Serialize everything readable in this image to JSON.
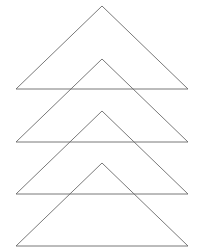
{
  "diagram": {
    "title": "",
    "stroke_color": "#6a6a6a",
    "background": "#ffffff",
    "shapes": [
      {
        "type": "triangle",
        "apex": [
          102,
          6
        ],
        "base_left": [
          16,
          89
        ],
        "base_right": [
          188,
          89
        ]
      },
      {
        "type": "triangle",
        "apex": [
          102,
          59
        ],
        "base_left": [
          16,
          142
        ],
        "base_right": [
          188,
          142
        ]
      },
      {
        "type": "triangle",
        "apex": [
          102,
          111
        ],
        "base_left": [
          16,
          194
        ],
        "base_right": [
          188,
          194
        ]
      },
      {
        "type": "triangle",
        "apex": [
          102,
          163
        ],
        "base_left": [
          16,
          246
        ],
        "base_right": [
          188,
          246
        ]
      }
    ]
  }
}
